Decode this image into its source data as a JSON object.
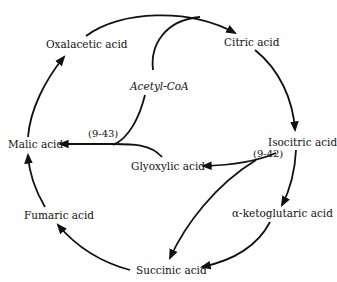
{
  "diagram": {
    "nodes": {
      "oxalacetic": "Oxalacetic acid",
      "citric": "Citric acid",
      "acetyl_coa": "Acetyl-CoA",
      "isocitric": "Isocitric acid",
      "glyoxylic": "Glyoxylic acid",
      "malic": "Malic acid",
      "ketoglutaric": "α-ketoglutaric acid",
      "fumaric": "Fumaric acid",
      "succinic": "Succinic acid"
    },
    "references": {
      "malate_synthase": "(9-43)",
      "isocitrate_lyase": "(9-42)"
    },
    "edges": [
      {
        "from": "Oxalacetic acid",
        "to": "Citric acid"
      },
      {
        "from": "Acetyl-CoA",
        "to": "Citric acid"
      },
      {
        "from": "Citric acid",
        "to": "Isocitric acid"
      },
      {
        "from": "Isocitric acid",
        "to": "α-ketoglutaric acid"
      },
      {
        "from": "α-ketoglutaric acid",
        "to": "Succinic acid"
      },
      {
        "from": "Succinic acid",
        "to": "Fumaric acid"
      },
      {
        "from": "Fumaric acid",
        "to": "Malic acid"
      },
      {
        "from": "Malic acid",
        "to": "Oxalacetic acid"
      },
      {
        "from": "Isocitric acid",
        "to": "Glyoxylic acid",
        "label": "(9-42)"
      },
      {
        "from": "Isocitric acid",
        "to": "Succinic acid",
        "label": "(9-42)"
      },
      {
        "from": "Glyoxylic acid",
        "to": "Malic acid",
        "label": "(9-43)"
      },
      {
        "from": "Acetyl-CoA",
        "to": "Malic acid",
        "label": "(9-43)"
      }
    ]
  }
}
